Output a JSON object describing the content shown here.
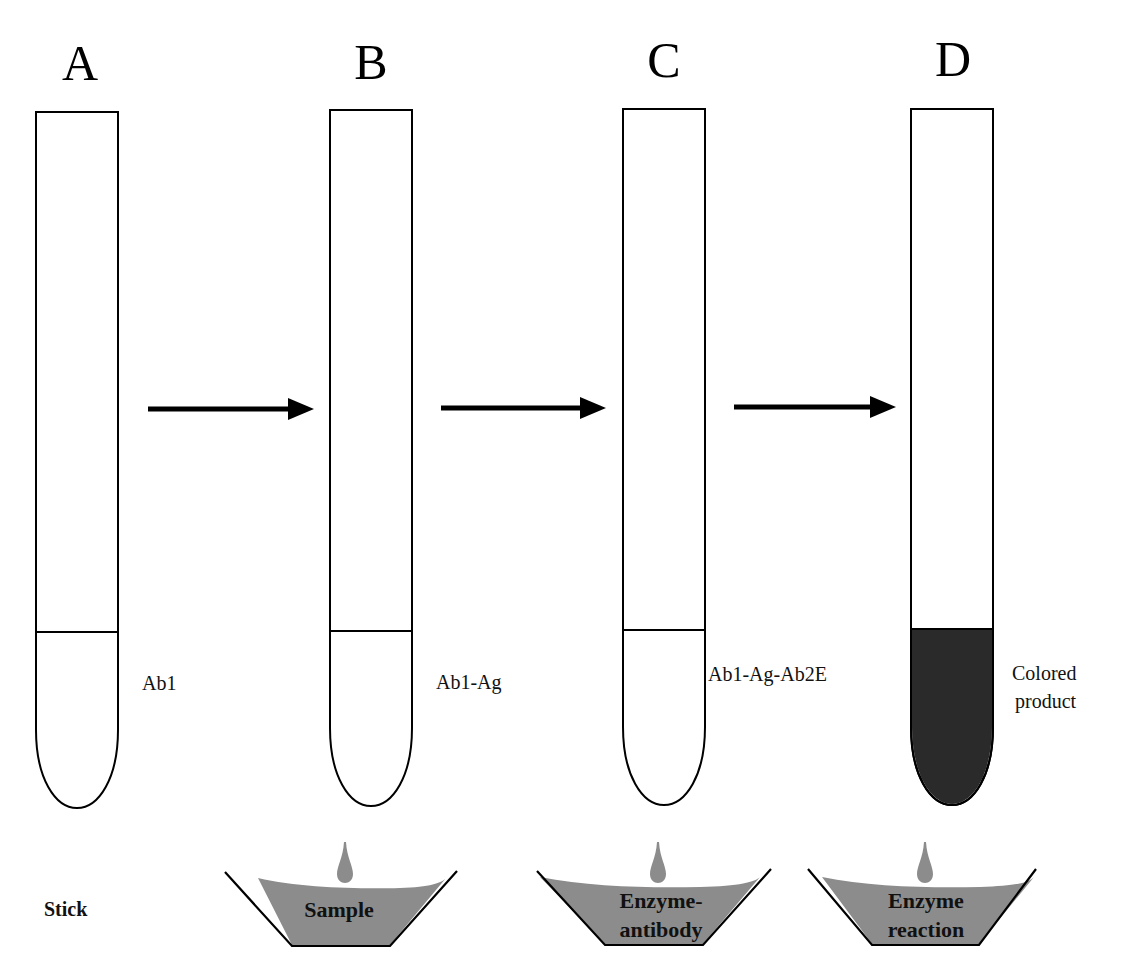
{
  "figure": {
    "steps": [
      {
        "letter": "A",
        "tube_label": [
          "Ab1"
        ],
        "tube_filled": false,
        "bottom_label": "Stick"
      },
      {
        "letter": "B",
        "tube_label": [
          "Ab1-Ag"
        ],
        "tube_filled": false,
        "trough_label": [
          "Sample"
        ]
      },
      {
        "letter": "C",
        "tube_label": [
          "Ab1-Ag-Ab2E"
        ],
        "tube_filled": false,
        "trough_label": [
          "Enzyme-",
          "antibody"
        ]
      },
      {
        "letter": "D",
        "tube_label": [
          "Colored",
          "product"
        ],
        "tube_filled": true,
        "trough_label": [
          "Enzyme",
          "reaction"
        ]
      }
    ],
    "arrows": 3,
    "colors": {
      "liquid": "#8c8c8c",
      "colored_product": "#2a2a2a",
      "outline": "#000000",
      "background": "#ffffff"
    }
  }
}
